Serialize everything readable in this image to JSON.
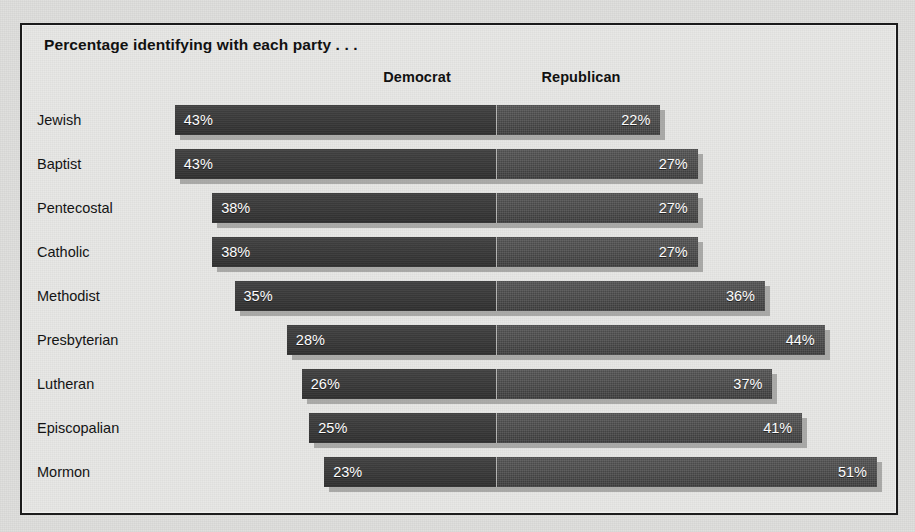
{
  "chart_data": {
    "type": "bar",
    "subtype": "diverging-stacked-horizontal",
    "title": "Percentage identifying with each party . . .",
    "xlabel": "",
    "ylabel": "",
    "grid": false,
    "legend_position": "top",
    "axis_center_label": "0",
    "categories": [
      "Jewish",
      "Baptist",
      "Pentecostal",
      "Catholic",
      "Methodist",
      "Presbyterian",
      "Lutheran",
      "Episcopalian",
      "Mormon"
    ],
    "series": [
      {
        "name": "Democrat",
        "side": "left",
        "color": "#3a3a3a",
        "values": [
          43,
          43,
          38,
          38,
          35,
          28,
          26,
          25,
          23
        ],
        "value_labels": [
          "43%",
          "43%",
          "38%",
          "38%",
          "35%",
          "28%",
          "26%",
          "25%",
          "23%"
        ]
      },
      {
        "name": "Republican",
        "side": "right",
        "color": "#4c4c4c",
        "values": [
          22,
          27,
          27,
          27,
          36,
          44,
          37,
          41,
          51
        ],
        "value_labels": [
          "22%",
          "27%",
          "27%",
          "27%",
          "36%",
          "44%",
          "37%",
          "41%",
          "51%"
        ]
      }
    ],
    "units": "percent",
    "xlim": [
      -50,
      55
    ]
  },
  "legend": {
    "democrat_label": "Democrat",
    "republican_label": "Republican"
  },
  "colors": {
    "panel_background": "#e6e6e4",
    "page_background": "#dededc",
    "frame": "#1c1c1c",
    "democrat_bar": "#3a3a3a",
    "republican_bar": "#4c4c4c",
    "bar_shadow": "#78786f",
    "value_text": "#fdfdfd",
    "label_text": "#141414"
  }
}
